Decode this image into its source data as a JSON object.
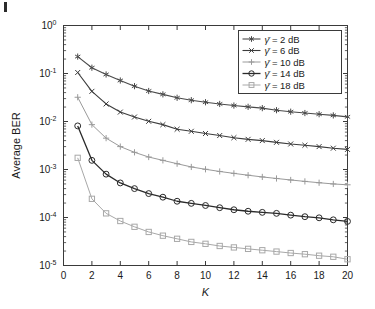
{
  "figure": {
    "background": "#ffffff",
    "axis_color": "#3a3a3a"
  },
  "chart_data": {
    "type": "line",
    "title": "",
    "subtitle": "",
    "xlabel": "K",
    "ylabel": "Average BER",
    "xscale": "linear",
    "yscale": "log",
    "xlim": [
      0,
      20
    ],
    "ylim": [
      1e-05,
      1
    ],
    "grid": false,
    "legend_position": "upper right",
    "xticks": [
      0,
      2,
      4,
      6,
      8,
      10,
      12,
      14,
      16,
      18,
      20
    ],
    "xticklabels": [
      "0",
      "2",
      "4",
      "6",
      "8",
      "10",
      "12",
      "14",
      "16",
      "18",
      "20"
    ],
    "yticks": [
      1,
      0.1,
      0.01,
      0.001,
      0.0001,
      1e-05
    ],
    "yticklabels": [
      "10^0",
      "10^-1",
      "10^-2",
      "10^-3",
      "10^-4",
      "10^-5"
    ],
    "ytick_mantissa": [
      "10",
      "10",
      "10",
      "10",
      "10",
      "10"
    ],
    "ytick_exponent": [
      "0",
      "-1",
      "-2",
      "-3",
      "-4",
      "-5"
    ],
    "x": [
      1,
      2,
      3,
      4,
      5,
      6,
      7,
      8,
      9,
      10,
      11,
      12,
      13,
      14,
      15,
      16,
      17,
      18,
      19,
      20
    ],
    "series": [
      {
        "name": "2 dB",
        "legend_label_prefix": "γ̄",
        "legend_label": "γ̄ = 2 dB",
        "marker": "asterisk",
        "color": "#4a4a4a",
        "linewidth": 1.1,
        "values": [
          0.225,
          0.132,
          0.0955,
          0.0715,
          0.0545,
          0.0432,
          0.0368,
          0.0312,
          0.0278,
          0.0252,
          0.0232,
          0.0215,
          0.0202,
          0.019,
          0.0172,
          0.016,
          0.015,
          0.0142,
          0.0134,
          0.0125
        ]
      },
      {
        "name": "6 dB",
        "legend_label_prefix": "γ̄",
        "legend_label": "γ̄ = 6 dB",
        "marker": "cross",
        "color": "#3c3c3c",
        "linewidth": 1.1,
        "values": [
          0.105,
          0.0425,
          0.0232,
          0.0157,
          0.0124,
          0.0101,
          0.0086,
          0.0069,
          0.00625,
          0.00562,
          0.0051,
          0.0046,
          0.00425,
          0.004,
          0.00368,
          0.0034,
          0.0032,
          0.003,
          0.00278,
          0.00262
        ]
      },
      {
        "name": "10 dB",
        "legend_label_prefix": "γ̄",
        "legend_label": "γ̄ = 10 dB",
        "marker": "plus",
        "color": "#9a9a9a",
        "linewidth": 1.0,
        "values": [
          0.032,
          0.0086,
          0.0045,
          0.003,
          0.00228,
          0.00182,
          0.00155,
          0.00132,
          0.00113,
          0.00101,
          0.00091,
          0.00083,
          0.00076,
          0.0007,
          0.00065,
          0.000605,
          0.000565,
          0.00053,
          0.0005,
          0.00048
        ]
      },
      {
        "name": "14 dB",
        "legend_label_prefix": "γ̄",
        "legend_label": "γ̄ = 14 dB",
        "marker": "circle",
        "color": "#2a2a2a",
        "linewidth": 1.3,
        "values": [
          0.0081,
          0.00155,
          0.0008,
          0.000525,
          0.0004,
          0.000315,
          0.000265,
          0.000218,
          0.000197,
          0.000178,
          0.00016,
          0.000145,
          0.000135,
          0.000128,
          0.000122,
          0.000112,
          0.000104,
          9.85e-05,
          8.95e-05,
          8.3e-05
        ]
      },
      {
        "name": "18 dB",
        "legend_label_prefix": "γ̄",
        "legend_label": "γ̄ = 18 dB",
        "marker": "square",
        "color": "#a8a8a8",
        "linewidth": 1.0,
        "values": [
          0.00175,
          0.000245,
          0.000122,
          8.45e-05,
          6.4e-05,
          5e-05,
          4.18e-05,
          3.6e-05,
          3.1e-05,
          2.83e-05,
          2.55e-05,
          2.38e-05,
          2.22e-05,
          2.08e-05,
          1.95e-05,
          1.82e-05,
          1.72e-05,
          1.6e-05,
          1.52e-05,
          1.35e-05
        ]
      }
    ]
  }
}
